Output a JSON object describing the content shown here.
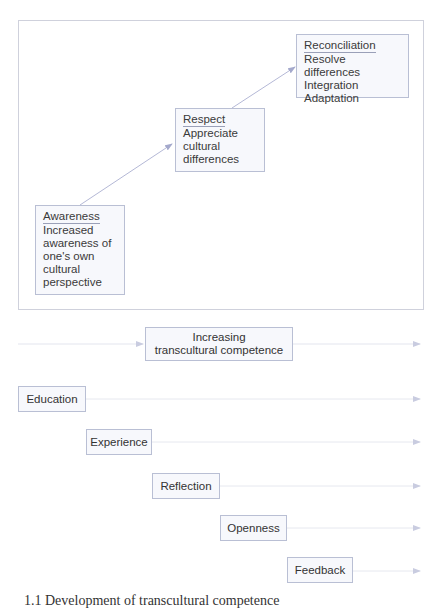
{
  "stages": [
    {
      "title": "Awareness",
      "lines": [
        "Increased",
        "awareness of",
        "one's own",
        "cultural",
        "perspective"
      ]
    },
    {
      "title": "Respect",
      "lines": [
        "Appreciate",
        "cultural",
        "differences"
      ]
    },
    {
      "title": "Reconciliation",
      "lines": [
        "Resolve differences",
        "Integration",
        "Adaptation"
      ]
    }
  ],
  "progress": {
    "label_line1": "Increasing",
    "label_line2": "transcultural competence"
  },
  "factors": [
    {
      "label": "Education"
    },
    {
      "label": "Experience"
    },
    {
      "label": "Reflection"
    },
    {
      "label": "Openness"
    },
    {
      "label": "Feedback"
    }
  ],
  "caption": {
    "text": "1.1 Development of transcultural competence"
  },
  "colors": {
    "box_border": "#b9bfd4",
    "box_fill": "#f7f8fc",
    "arrow": "#a9aed0",
    "line": "#e3e5ee"
  }
}
